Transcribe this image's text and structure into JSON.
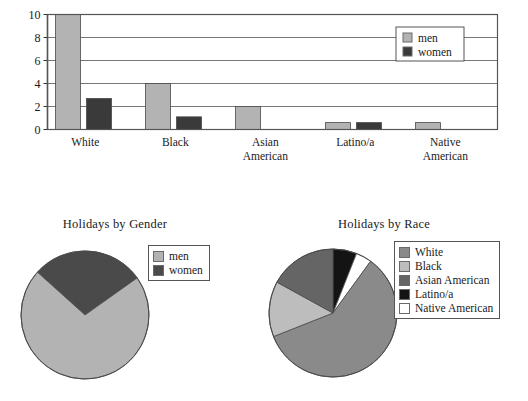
{
  "chart_data": [
    {
      "type": "bar",
      "title": "",
      "xlabel": "",
      "ylabel": "",
      "ylim": [
        0,
        10
      ],
      "yticks": [
        0,
        2,
        4,
        6,
        8,
        10
      ],
      "grid": true,
      "legend_position": "top-right",
      "categories": [
        "White",
        "Black",
        "Asian\nAmerican",
        "Latino/a",
        "Native\nAmerican"
      ],
      "category_lines": [
        [
          "White"
        ],
        [
          "Black"
        ],
        [
          "Asian",
          "American"
        ],
        [
          "Latino/a"
        ],
        [
          "Native",
          "American"
        ]
      ],
      "series": [
        {
          "name": "men",
          "color": "#b3b3b3",
          "values": [
            10,
            4,
            2,
            0.6,
            0.6
          ]
        },
        {
          "name": "women",
          "color": "#3a3a3a",
          "values": [
            2.7,
            1.1,
            0,
            0.6,
            0
          ]
        }
      ]
    },
    {
      "type": "pie",
      "title": "Holidays by Gender",
      "legend_position": "right",
      "labels": [
        "men",
        "women"
      ],
      "values": [
        71.5,
        28.5
      ],
      "colors": [
        "#b3b3b3",
        "#4a4a4a"
      ]
    },
    {
      "type": "pie",
      "title": "Holidays by Race",
      "legend_position": "right",
      "labels": [
        "White",
        "Black",
        "Asian American",
        "Latino/a",
        "Native American"
      ],
      "values": [
        59,
        14,
        17,
        6,
        4
      ],
      "colors": [
        "#8a8a8a",
        "#bdbdbd",
        "#656565",
        "#141414",
        "#ffffff"
      ]
    }
  ],
  "bar_chart": {
    "name": "bar-chart",
    "yticks": [
      "0",
      "2",
      "4",
      "6",
      "8",
      "10"
    ],
    "categories": [
      {
        "line1": "White",
        "line2": ""
      },
      {
        "line1": "Black",
        "line2": ""
      },
      {
        "line1": "Asian",
        "line2": "American"
      },
      {
        "line1": "Latino/a",
        "line2": ""
      },
      {
        "line1": "Native",
        "line2": "American"
      }
    ],
    "legend": {
      "items": [
        {
          "label": "men",
          "color": "#b3b3b3"
        },
        {
          "label": "women",
          "color": "#3a3a3a"
        }
      ]
    }
  },
  "pie_gender": {
    "title": "Holidays by Gender",
    "legend": {
      "items": [
        {
          "label": "men",
          "color": "#b3b3b3"
        },
        {
          "label": "women",
          "color": "#4a4a4a"
        }
      ]
    }
  },
  "pie_race": {
    "title": "Holidays by Race",
    "legend": {
      "items": [
        {
          "label": "White",
          "color": "#8a8a8a"
        },
        {
          "label": "Black",
          "color": "#bdbdbd"
        },
        {
          "label": "Asian American",
          "color": "#656565"
        },
        {
          "label": "Latino/a",
          "color": "#141414"
        },
        {
          "label": "Native American",
          "color": "#ffffff"
        }
      ]
    }
  }
}
